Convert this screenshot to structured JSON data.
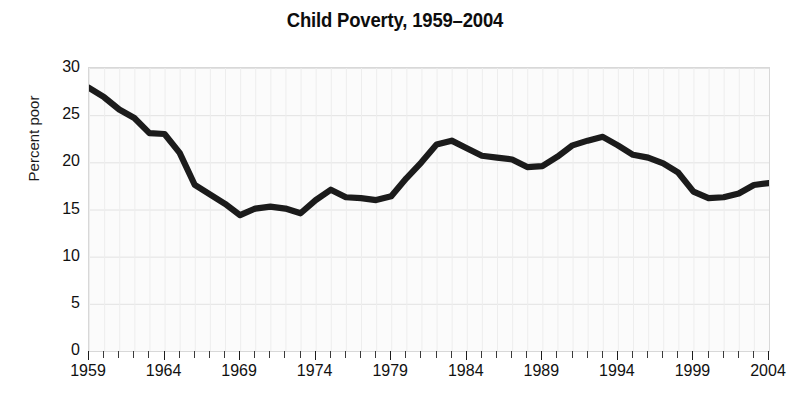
{
  "chart_data": {
    "type": "line",
    "title": "Child Poverty, 1959–2004",
    "xlabel": "",
    "ylabel": "Percent poor",
    "xlim": [
      1959,
      2004
    ],
    "ylim": [
      0,
      30
    ],
    "grid": true,
    "legend": "none",
    "y_ticks": [
      0,
      5,
      10,
      15,
      20,
      25,
      30
    ],
    "y_tick_labels": [
      "0",
      "5",
      "10",
      "15",
      "20",
      "25",
      "30"
    ],
    "x_ticks_labeled": [
      1959,
      1964,
      1969,
      1974,
      1979,
      1984,
      1989,
      1994,
      1999,
      2004
    ],
    "x_tick_labels": [
      "1959",
      "1964",
      "1969",
      "1974",
      "1979",
      "1984",
      "1989",
      "1994",
      "1999",
      "2004"
    ],
    "x_tick_interval_minor": 1,
    "series": [
      {
        "name": "Percent poor",
        "color": "#1b1b1b",
        "x": [
          1959,
          1960,
          1961,
          1962,
          1963,
          1964,
          1965,
          1966,
          1967,
          1968,
          1969,
          1970,
          1971,
          1972,
          1973,
          1974,
          1975,
          1976,
          1977,
          1978,
          1979,
          1980,
          1981,
          1982,
          1983,
          1984,
          1985,
          1986,
          1987,
          1988,
          1989,
          1990,
          1991,
          1992,
          1993,
          1994,
          1995,
          1996,
          1997,
          1998,
          1999,
          2000,
          2001,
          2002,
          2003,
          2004
        ],
        "values": [
          27.9,
          26.9,
          25.6,
          24.7,
          23.1,
          23.0,
          21.0,
          17.6,
          16.6,
          15.6,
          14.4,
          15.1,
          15.3,
          15.1,
          14.6,
          16.0,
          17.1,
          16.3,
          16.2,
          16.0,
          16.4,
          18.3,
          20.0,
          21.9,
          22.3,
          21.5,
          20.7,
          20.5,
          20.3,
          19.5,
          19.6,
          20.6,
          21.8,
          22.3,
          22.7,
          21.8,
          20.8,
          20.5,
          19.9,
          18.9,
          16.9,
          16.2,
          16.3,
          16.7,
          17.6,
          17.8
        ]
      }
    ]
  },
  "title": {
    "text": "Child Poverty, 1959–2004"
  },
  "axes": {
    "y_label": "Percent poor"
  }
}
